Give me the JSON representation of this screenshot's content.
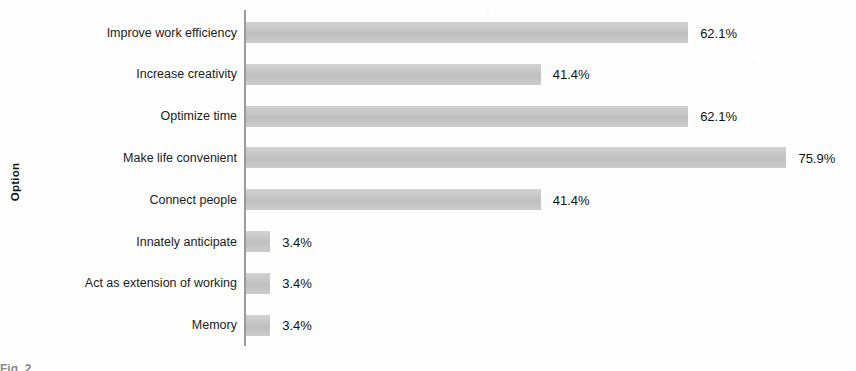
{
  "chart_data": {
    "type": "bar",
    "orientation": "horizontal",
    "title": "",
    "xlabel": "",
    "ylabel": "Option",
    "categories": [
      "Improve work efficiency",
      "Increase creativity",
      "Optimize time",
      "Make life convenient",
      "Connect people",
      "Innately anticipate",
      "Act as extension of working",
      "Memory"
    ],
    "values": [
      62.1,
      41.4,
      62.1,
      75.9,
      41.4,
      3.4,
      3.4,
      3.4
    ],
    "value_labels": [
      "62.1%",
      "41.4%",
      "62.1%",
      "75.9%",
      "41.4%",
      "3.4%",
      "3.4%",
      "3.4%"
    ],
    "xlim": [
      0,
      85
    ],
    "grid": false,
    "legend": null,
    "bar_color": "#c6c6c6",
    "axis_color": "#9a9a9a",
    "text_color": "#1a1a1a"
  },
  "axis": {
    "y_title": "Option"
  },
  "caption": {
    "prefix": "Fig. 2",
    "text": ""
  }
}
